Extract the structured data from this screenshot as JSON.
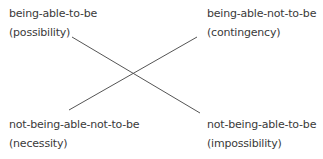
{
  "diagram": {
    "type": "square-of-opposition-cross",
    "corners": {
      "top_left": {
        "term": "being-able-to-be",
        "gloss": "(possibility)"
      },
      "top_right": {
        "term": "being-able-not-to-be",
        "gloss": "(contingency)"
      },
      "bottom_left": {
        "term": "not-being-able-not-to-be",
        "gloss": "(necessity)"
      },
      "bottom_right": {
        "term": "not-being-able-to-be",
        "gloss": "(impossibility)"
      }
    },
    "connections": [
      {
        "from": "top_left",
        "to": "bottom_right"
      },
      {
        "from": "bottom_left",
        "to": "top_right"
      }
    ],
    "colors": {
      "text": "#3a3a3a",
      "line": "#555555",
      "background": "#ffffff"
    }
  }
}
